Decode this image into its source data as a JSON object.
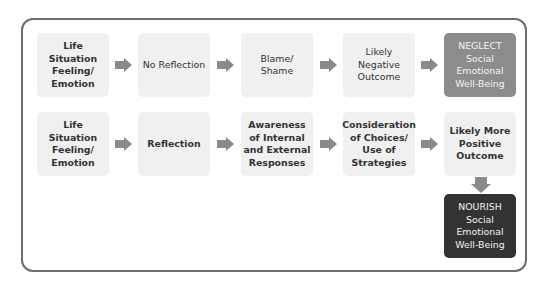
{
  "diagram": {
    "row1": [
      {
        "label": "Life Situation\nFeeling/\nEmotion",
        "weight": "bold"
      },
      {
        "label": "No Reflection",
        "weight": "normal"
      },
      {
        "label": "Blame/\nShame",
        "weight": "normal"
      },
      {
        "label": "Likely\nNegative\nOutcome",
        "weight": "normal"
      },
      {
        "label": "NEGLECT\nSocial\nEmotional\nWell-Being",
        "weight": "normal",
        "fill": "#8c8c8c"
      }
    ],
    "row2": [
      {
        "label": "Life Situation\nFeeling/\nEmotion",
        "weight": "bold"
      },
      {
        "label": "Reflection",
        "weight": "bold"
      },
      {
        "label": "Awareness\nof Internal\nand External\nResponses",
        "weight": "bold"
      },
      {
        "label": "Consideration\nof Choices/\nUse of\nStrategies",
        "weight": "bold"
      },
      {
        "label": "Likely More\nPositive\nOutcome",
        "weight": "bold"
      }
    ],
    "final": {
      "label": "NOURISH\nSocial\nEmotional\nWell-Being",
      "fill": "#333333"
    },
    "colors": {
      "box": "#f0f0f0",
      "arrow": "#8a8a8a",
      "border": "#6d6d6d"
    }
  }
}
